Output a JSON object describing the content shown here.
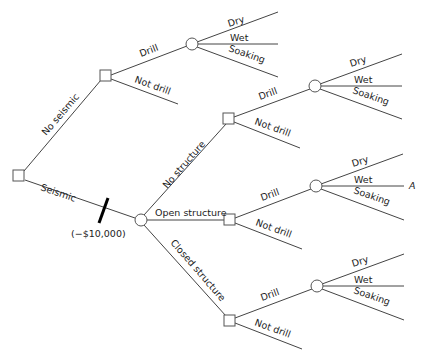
{
  "diagram": {
    "type": "decision-tree",
    "root": {
      "kind": "decision",
      "branches": {
        "no_seismic": "No seismic",
        "seismic": "Seismic",
        "seismic_cost": "(−$10,000)"
      }
    },
    "no_seismic_node": {
      "drill": "Drill",
      "not_drill": "Not drill",
      "outcomes": [
        "Dry",
        "Wet",
        "Soaking"
      ]
    },
    "seismic_node": {
      "no_structure": "No structure",
      "open_structure": "Open structure",
      "closed_structure": "Closed structure"
    },
    "no_structure_node": {
      "drill": "Drill",
      "not_drill": "Not drill",
      "outcomes": [
        "Dry",
        "Wet",
        "Soaking"
      ]
    },
    "open_structure_node": {
      "drill": "Drill",
      "not_drill": "Not drill",
      "outcomes": [
        "Dry",
        "Wet",
        "Soaking"
      ],
      "endpoint_marker": "A"
    },
    "closed_structure_node": {
      "drill": "Drill",
      "not_drill": "Not drill",
      "outcomes": [
        "Dry",
        "Wet",
        "Soaking"
      ]
    }
  }
}
